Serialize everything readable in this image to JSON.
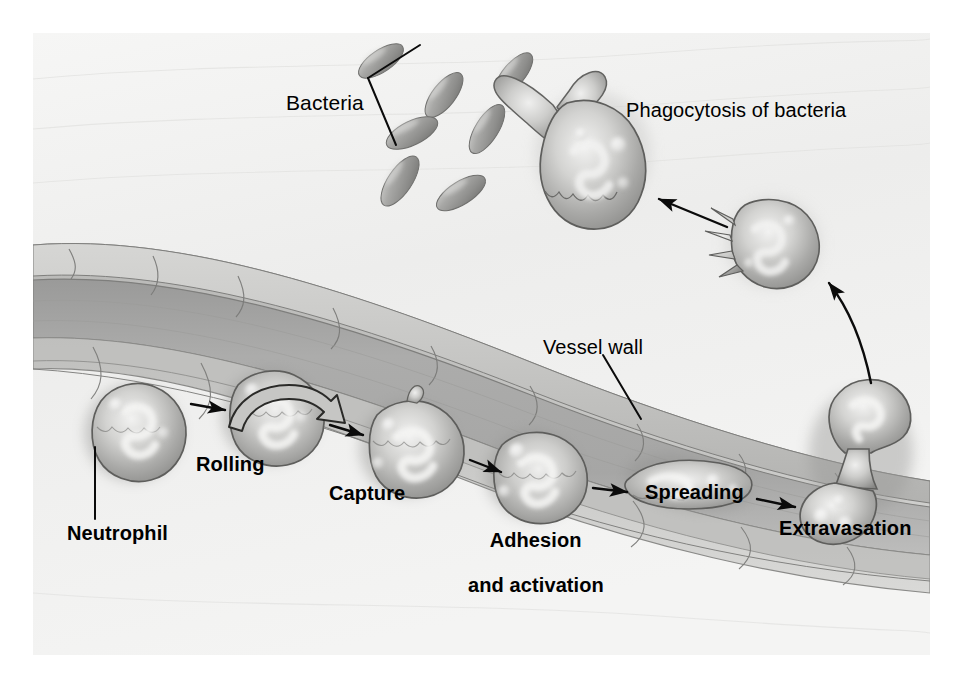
{
  "figure": {
    "background_color": "#f1f1f0",
    "page_color": "#ffffff",
    "ink_color": "#000000"
  },
  "labels": {
    "bacteria": {
      "text": "Bacteria",
      "bold": false,
      "x": 286,
      "y": 70,
      "size": 21
    },
    "phagocytosis": {
      "text": "Phagocytosis of bacteria",
      "bold": false,
      "x": 626,
      "y": 78,
      "size": 20
    },
    "vessel_wall": {
      "text": "Vessel wall",
      "bold": false,
      "x": 543,
      "y": 334,
      "size": 20
    },
    "neutrophil": {
      "text": "Neutrophil",
      "bold": true,
      "x": 67,
      "y": 519,
      "size": 20
    },
    "rolling": {
      "text": "Rolling",
      "bold": true,
      "x": 196,
      "y": 451,
      "size": 20
    },
    "capture": {
      "text": "Capture",
      "bold": true,
      "x": 329,
      "y": 480,
      "size": 20
    },
    "adhesion_line1": {
      "text": "Adhesion",
      "bold": true,
      "x": 449,
      "y": 505,
      "size": 20
    },
    "adhesion_line2": {
      "text": "and activation",
      "bold": true,
      "x": 429,
      "y": 528,
      "size": 20
    },
    "spreading": {
      "text": "Spreading",
      "bold": true,
      "x": 645,
      "y": 479,
      "size": 20
    },
    "extravasation": {
      "text": "Extravasation",
      "bold": true,
      "x": 779,
      "y": 515,
      "size": 20
    }
  },
  "stages": [
    {
      "id": "neutrophil",
      "label": "Neutrophil",
      "order": 1,
      "location": "lumen"
    },
    {
      "id": "rolling",
      "label": "Rolling",
      "order": 2,
      "location": "lumen"
    },
    {
      "id": "capture",
      "label": "Capture",
      "order": 3,
      "location": "vessel-wall"
    },
    {
      "id": "adhesion",
      "label": "Adhesion and activation",
      "order": 4,
      "location": "vessel-wall"
    },
    {
      "id": "spreading",
      "label": "Spreading",
      "order": 5,
      "location": "vessel-wall"
    },
    {
      "id": "extravasation",
      "label": "Extravasation",
      "order": 6,
      "location": "vessel-wall"
    },
    {
      "id": "phagocytosis",
      "label": "Phagocytosis of bacteria",
      "order": 7,
      "location": "tissue"
    }
  ],
  "annotations": {
    "bacteria_count": 7,
    "neutrophil_count": 8,
    "arrow_count": 7,
    "rolling_arrow": "curved-clockwise-outline-arrow"
  },
  "icons": {
    "bacterium": "rod-shaped-bacterium-icon",
    "neutrophil": "neutrophil-cell-icon",
    "arrow": "arrow-icon",
    "leader_line": "leader-line-icon"
  }
}
